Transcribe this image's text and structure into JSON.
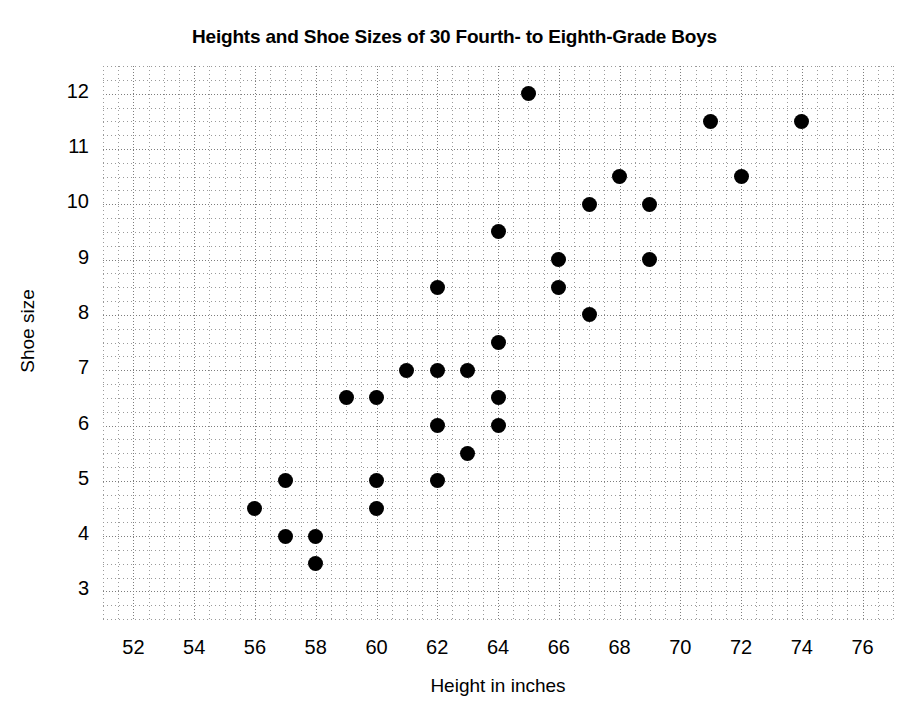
{
  "chart_data": {
    "type": "scatter",
    "title": "Heights and Shoe Sizes of 30 Fourth- to Eighth-Grade Boys",
    "xlabel": "Height in inches",
    "ylabel": "Shoe size",
    "xlim": [
      51,
      77
    ],
    "ylim": [
      2.5,
      12.5
    ],
    "xticks": [
      52,
      54,
      56,
      58,
      60,
      62,
      64,
      66,
      68,
      70,
      72,
      74,
      76
    ],
    "yticks": [
      3,
      4,
      5,
      6,
      7,
      8,
      9,
      10,
      11,
      12
    ],
    "x_minor_step": 0.5,
    "y_minor_step": 0.25,
    "grid": true,
    "legend": null,
    "marker": {
      "shape": "circle",
      "color": "#000000",
      "size_px": 15
    },
    "n_points": 31,
    "x": [
      56,
      57,
      57,
      58,
      58,
      59,
      60,
      60,
      60,
      61,
      62,
      62,
      62,
      62,
      63,
      63,
      64,
      64,
      64,
      64,
      65,
      66,
      66,
      67,
      67,
      68,
      69,
      69,
      71,
      72,
      74
    ],
    "y": [
      4.5,
      5,
      4,
      4,
      3.5,
      6.5,
      6.5,
      5,
      4.5,
      7,
      8.5,
      7,
      6,
      5,
      7,
      5.5,
      9.5,
      7.5,
      6.5,
      6,
      12,
      9,
      8.5,
      10,
      8,
      10.5,
      10,
      9,
      11.5,
      10.5,
      11.5
    ],
    "points": [
      {
        "height": 56,
        "shoe_size": 4.5
      },
      {
        "height": 57,
        "shoe_size": 5
      },
      {
        "height": 57,
        "shoe_size": 4
      },
      {
        "height": 58,
        "shoe_size": 4
      },
      {
        "height": 58,
        "shoe_size": 3.5
      },
      {
        "height": 59,
        "shoe_size": 6.5
      },
      {
        "height": 60,
        "shoe_size": 6.5
      },
      {
        "height": 60,
        "shoe_size": 5
      },
      {
        "height": 60,
        "shoe_size": 4.5
      },
      {
        "height": 61,
        "shoe_size": 7
      },
      {
        "height": 62,
        "shoe_size": 8.5
      },
      {
        "height": 62,
        "shoe_size": 7
      },
      {
        "height": 62,
        "shoe_size": 6
      },
      {
        "height": 62,
        "shoe_size": 5
      },
      {
        "height": 63,
        "shoe_size": 7
      },
      {
        "height": 63,
        "shoe_size": 5.5
      },
      {
        "height": 64,
        "shoe_size": 9.5
      },
      {
        "height": 64,
        "shoe_size": 7.5
      },
      {
        "height": 64,
        "shoe_size": 6.5
      },
      {
        "height": 64,
        "shoe_size": 6
      },
      {
        "height": 65,
        "shoe_size": 12
      },
      {
        "height": 66,
        "shoe_size": 9
      },
      {
        "height": 66,
        "shoe_size": 8.5
      },
      {
        "height": 67,
        "shoe_size": 10
      },
      {
        "height": 67,
        "shoe_size": 8
      },
      {
        "height": 68,
        "shoe_size": 10.5
      },
      {
        "height": 69,
        "shoe_size": 10
      },
      {
        "height": 69,
        "shoe_size": 9
      },
      {
        "height": 71,
        "shoe_size": 11.5
      },
      {
        "height": 72,
        "shoe_size": 10.5
      },
      {
        "height": 74,
        "shoe_size": 11.5
      }
    ]
  }
}
